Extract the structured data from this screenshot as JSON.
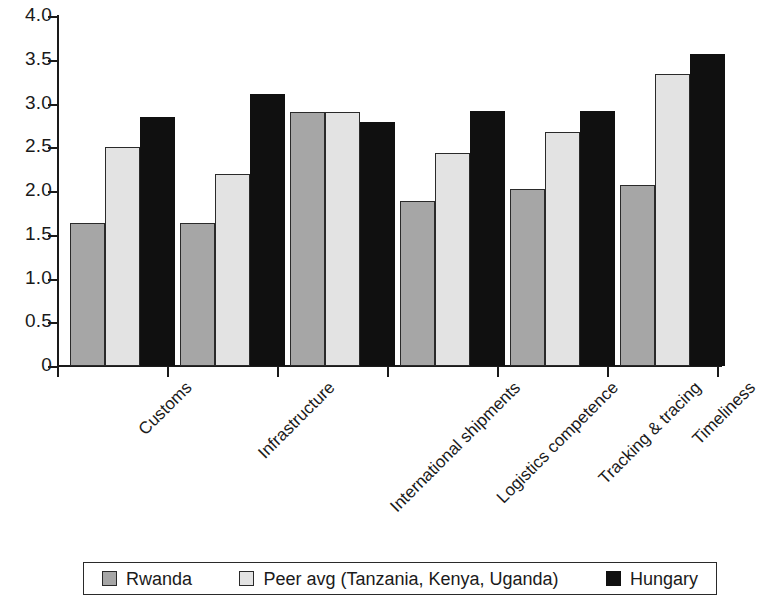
{
  "chart_data": {
    "type": "bar",
    "title": "",
    "subtitle": "",
    "xlabel": "",
    "ylabel": "",
    "ylim": [
      0,
      4.0
    ],
    "ytick_labels": [
      "4.0",
      "3.5",
      "3.0",
      "2.5",
      "2.0",
      "1.5",
      "1.0",
      "0.5",
      "0"
    ],
    "ytick_values": [
      4.0,
      3.5,
      3.0,
      2.5,
      2.0,
      1.5,
      1.0,
      0.5,
      0
    ],
    "grid": false,
    "legend_position": "bottom",
    "categories": [
      "Customs",
      "Infrastructure",
      "International shipments",
      "Logistics competence",
      "Tracking & tracing",
      "Timeliness"
    ],
    "series": [
      {
        "name": "Rwanda",
        "color": "#a6a6a6",
        "values": [
          1.64,
          1.64,
          2.9,
          1.89,
          2.02,
          2.07
        ]
      },
      {
        "name": "Peer avg (Tanzania, Kenya, Uganda)",
        "color": "#e3e3e3",
        "values": [
          2.5,
          2.2,
          2.9,
          2.44,
          2.67,
          3.34
        ]
      },
      {
        "name": "Hungary",
        "color": "#101010",
        "values": [
          2.85,
          3.11,
          2.79,
          2.91,
          2.91,
          3.57
        ]
      }
    ]
  },
  "legend": {
    "items": [
      {
        "label": "Rwanda"
      },
      {
        "label": "Peer avg (Tanzania, Kenya, Uganda)"
      },
      {
        "label": "Hungary"
      }
    ]
  }
}
